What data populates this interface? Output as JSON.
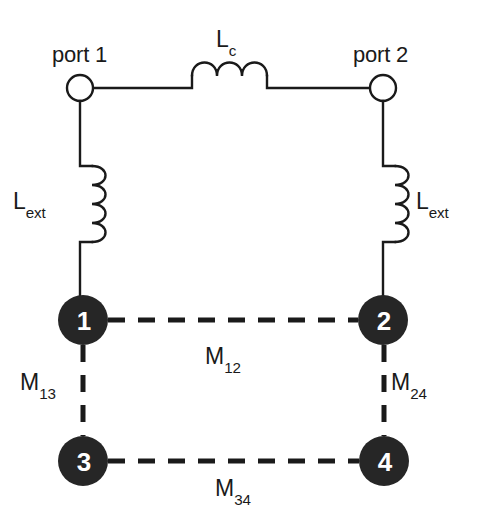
{
  "figure": {
    "type": "circuit-schematic",
    "background_color": "#ffffff",
    "line_color": "#1a1a1a",
    "node_fill_color": "#262626",
    "node_text_color": "#ffffff"
  },
  "ports": [
    {
      "id": "port1",
      "label": "port 1",
      "cx": 80,
      "cy": 88,
      "r": 13
    },
    {
      "id": "port2",
      "label": "port 2",
      "cx": 383,
      "cy": 88,
      "r": 13
    }
  ],
  "inductors": [
    {
      "id": "coupling",
      "label_base": "L",
      "label_sub": "c",
      "orientation": "horizontal",
      "humps": 3
    },
    {
      "id": "ext_left",
      "label_base": "L",
      "label_sub": "ext",
      "orientation": "vertical",
      "humps": 4
    },
    {
      "id": "ext_right",
      "label_base": "L",
      "label_sub": "ext",
      "orientation": "vertical",
      "humps": 4
    }
  ],
  "nodes": [
    {
      "id": "n1",
      "number": "1",
      "cx": 83,
      "cy": 320,
      "r": 25
    },
    {
      "id": "n2",
      "number": "2",
      "cx": 383,
      "cy": 320,
      "r": 25
    },
    {
      "id": "n3",
      "number": "3",
      "cx": 83,
      "cy": 461,
      "r": 25
    },
    {
      "id": "n4",
      "number": "4",
      "cx": 384,
      "cy": 461,
      "r": 25
    }
  ],
  "couplings": [
    {
      "id": "m12",
      "label_base": "M",
      "label_sub": "12",
      "from": "n1",
      "to": "n2",
      "style": "dashed"
    },
    {
      "id": "m13",
      "label_base": "M",
      "label_sub": "13",
      "from": "n1",
      "to": "n3",
      "style": "dashed"
    },
    {
      "id": "m24",
      "label_base": "M",
      "label_sub": "24",
      "from": "n2",
      "to": "n4",
      "style": "dashed"
    },
    {
      "id": "m34",
      "label_base": "M",
      "label_sub": "34",
      "from": "n3",
      "to": "n4",
      "style": "dashed"
    }
  ]
}
